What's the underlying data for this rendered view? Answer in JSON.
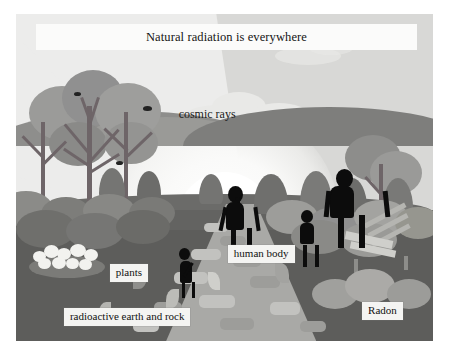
{
  "illustration": {
    "title": "Natural radiation is everywhere",
    "alt_description": "Illustration of a family walking on a stone path at sunrise with trees, bushes and a bench",
    "labels": {
      "cosmic_rays": "cosmic rays",
      "human_body": "human body",
      "plants": "plants",
      "radioactive_earth_and_rock": "radioactive earth and rock",
      "radon": "Radon"
    },
    "colors": {
      "sky": "#d8d8d6",
      "ray": "#ececeb",
      "sun": "#ffffff",
      "ground": "#636361",
      "path": "#a9a9a6",
      "silhouette": "#0c0c0c",
      "label_background": "#f4f4f2",
      "label_text": "#111111"
    },
    "figures": [
      {
        "name": "child-left",
        "type": "silhouette"
      },
      {
        "name": "woman",
        "type": "silhouette"
      },
      {
        "name": "child-right",
        "type": "silhouette"
      },
      {
        "name": "man",
        "type": "silhouette"
      }
    ]
  }
}
